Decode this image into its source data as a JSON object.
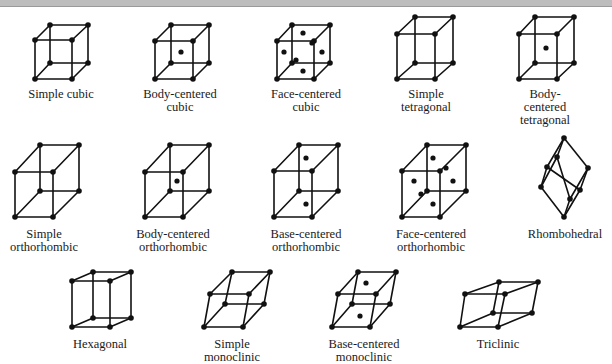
{
  "colors": {
    "line": "#111111",
    "background": "#ffffff",
    "topbar": "#bdbdbd"
  },
  "lattices": [
    {
      "name": "Simple cubic",
      "caption": "Simple cubic",
      "caption_pos": [
        61,
        88
      ],
      "box": {
        "front": [
          [
            35,
            40
          ],
          [
            72,
            40
          ],
          [
            72,
            79
          ],
          [
            35,
            79
          ]
        ],
        "back": [
          [
            50,
            25
          ],
          [
            88,
            25
          ],
          [
            88,
            63
          ],
          [
            50,
            63
          ]
        ]
      },
      "centers": []
    },
    {
      "name": "Body-centered cubic",
      "caption": "Body-centered\ncubic",
      "caption_pos": [
        180,
        88
      ],
      "box": {
        "front": [
          [
            155,
            41
          ],
          [
            193,
            41
          ],
          [
            193,
            79
          ],
          [
            155,
            79
          ]
        ],
        "back": [
          [
            171,
            25
          ],
          [
            209,
            25
          ],
          [
            209,
            63
          ],
          [
            171,
            63
          ]
        ]
      },
      "centers": [
        [
          181,
          52
        ]
      ]
    },
    {
      "name": "Face-centered cubic",
      "caption": "Face-centered\ncubic",
      "caption_pos": [
        306,
        88
      ],
      "box": {
        "front": [
          [
            277,
            41
          ],
          [
            314,
            41
          ],
          [
            314,
            79
          ],
          [
            277,
            79
          ]
        ],
        "back": [
          [
            292,
            25
          ],
          [
            330,
            25
          ],
          [
            330,
            63
          ],
          [
            292,
            63
          ]
        ]
      },
      "centers": [
        [
          303,
          33
        ],
        [
          303,
          71
        ],
        [
          284,
          52
        ],
        [
          322,
          52
        ],
        [
          296,
          60
        ],
        [
          312,
          43
        ]
      ]
    },
    {
      "name": "Simple tetragonal",
      "caption": "Simple\ntetragonal",
      "caption_pos": [
        426,
        88
      ],
      "box": {
        "front": [
          [
            397,
            34
          ],
          [
            435,
            34
          ],
          [
            435,
            79
          ],
          [
            397,
            79
          ]
        ],
        "back": [
          [
            415,
            17
          ],
          [
            453,
            17
          ],
          [
            453,
            63
          ],
          [
            415,
            63
          ]
        ]
      },
      "centers": []
    },
    {
      "name": "Body-centered tetragonal",
      "caption": "Body-centered\ntetragonal",
      "caption_pos": [
        545,
        88
      ],
      "box": {
        "front": [
          [
            519,
            34
          ],
          [
            557,
            34
          ],
          [
            557,
            79
          ],
          [
            519,
            79
          ]
        ],
        "back": [
          [
            535,
            17
          ],
          [
            574,
            17
          ],
          [
            574,
            63
          ],
          [
            535,
            63
          ]
        ]
      },
      "centers": [
        [
          546,
          48
        ]
      ]
    },
    {
      "name": "Simple orthorhombic",
      "caption": "Simple\northorhombic",
      "caption_pos": [
        44,
        228
      ],
      "box": {
        "front": [
          [
            15,
            172
          ],
          [
            53,
            172
          ],
          [
            53,
            217
          ],
          [
            15,
            217
          ]
        ],
        "back": [
          [
            40,
            145
          ],
          [
            79,
            145
          ],
          [
            79,
            191
          ],
          [
            40,
            191
          ]
        ]
      },
      "centers": []
    },
    {
      "name": "Body-centered orthorhombic",
      "caption": "Body-centered\northorhombic",
      "caption_pos": [
        173,
        228
      ],
      "box": {
        "front": [
          [
            145,
            172
          ],
          [
            183,
            172
          ],
          [
            183,
            217
          ],
          [
            145,
            217
          ]
        ],
        "back": [
          [
            170,
            145
          ],
          [
            209,
            145
          ],
          [
            209,
            191
          ],
          [
            170,
            191
          ]
        ]
      },
      "centers": [
        [
          177,
          181
        ]
      ]
    },
    {
      "name": "Base-centered orthorhombic",
      "caption": "Base-centered\northorhombic",
      "caption_pos": [
        306,
        228
      ],
      "box": {
        "front": [
          [
            274,
            171
          ],
          [
            312,
            171
          ],
          [
            312,
            217
          ],
          [
            274,
            217
          ]
        ],
        "back": [
          [
            299,
            145
          ],
          [
            338,
            145
          ],
          [
            338,
            191
          ],
          [
            299,
            191
          ]
        ]
      },
      "centers": [
        [
          306,
          158
        ],
        [
          306,
          204
        ]
      ]
    },
    {
      "name": "Face-centered orthorhombic",
      "caption": "Face-centered\northorhombic",
      "caption_pos": [
        431,
        228
      ],
      "box": {
        "front": [
          [
            402,
            171
          ],
          [
            440,
            171
          ],
          [
            440,
            217
          ],
          [
            402,
            217
          ]
        ],
        "back": [
          [
            427,
            145
          ],
          [
            466,
            145
          ],
          [
            466,
            191
          ],
          [
            427,
            191
          ]
        ]
      },
      "centers": [
        [
          433,
          158
        ],
        [
          433,
          204
        ],
        [
          414,
          181
        ],
        [
          453,
          181
        ],
        [
          421,
          194
        ],
        [
          446,
          168
        ]
      ]
    },
    {
      "name": "Rhombohedral",
      "caption": "Rhombohedral",
      "caption_pos": [
        565,
        228
      ],
      "poly": {
        "points": {
          "t": [
            564,
            138
          ],
          "a": [
            557,
            157
          ],
          "b": [
            547,
            167
          ],
          "c": [
            588,
            168
          ],
          "d": [
            541,
            187
          ],
          "e": [
            580,
            190
          ],
          "f": [
            570,
            199
          ],
          "bot": [
            564,
            217
          ]
        },
        "edges": [
          [
            "t",
            "b"
          ],
          [
            "t",
            "c"
          ],
          [
            "t",
            "a"
          ],
          [
            "a",
            "d"
          ],
          [
            "a",
            "f"
          ],
          [
            "b",
            "d"
          ],
          [
            "b",
            "e"
          ],
          [
            "c",
            "e"
          ],
          [
            "c",
            "f"
          ],
          [
            "d",
            "bot"
          ],
          [
            "e",
            "bot"
          ],
          [
            "f",
            "bot"
          ]
        ]
      },
      "centers": []
    },
    {
      "name": "Hexagonal",
      "caption": "Hexagonal",
      "caption_pos": [
        100,
        338
      ],
      "box": {
        "front": [
          [
            72,
            281
          ],
          [
            110,
            281
          ],
          [
            110,
            327
          ],
          [
            72,
            327
          ]
        ],
        "back": [
          [
            93,
            272
          ],
          [
            131,
            272
          ],
          [
            131,
            318
          ],
          [
            93,
            318
          ]
        ]
      },
      "centers": []
    },
    {
      "name": "Simple monoclinic",
      "caption": "Simple\nmonoclinic",
      "caption_pos": [
        232,
        338
      ],
      "box": {
        "front": [
          [
            210,
            294
          ],
          [
            249,
            294
          ],
          [
            243,
            327
          ],
          [
            204,
            327
          ]
        ],
        "back": [
          [
            232,
            272
          ],
          [
            270,
            272
          ],
          [
            264,
            304
          ],
          [
            225,
            304
          ]
        ]
      },
      "centers": []
    },
    {
      "name": "Base-centered monoclinic",
      "caption": "Base-centered\nmonoclinic",
      "caption_pos": [
        364,
        338
      ],
      "box": {
        "front": [
          [
            338,
            294
          ],
          [
            376,
            294
          ],
          [
            370,
            327
          ],
          [
            332,
            327
          ]
        ],
        "back": [
          [
            358,
            272
          ],
          [
            396,
            272
          ],
          [
            390,
            304
          ],
          [
            352,
            304
          ]
        ]
      },
      "centers": [
        [
          366,
          283
        ],
        [
          360,
          316
        ]
      ]
    },
    {
      "name": "Triclinic",
      "caption": "Triclinic",
      "caption_pos": [
        498,
        338
      ],
      "box": {
        "front": [
          [
            465,
            294
          ],
          [
            505,
            294
          ],
          [
            498,
            327
          ],
          [
            460,
            327
          ]
        ],
        "back": [
          [
            499,
            282
          ],
          [
            538,
            282
          ],
          [
            532,
            313
          ],
          [
            493,
            313
          ]
        ]
      },
      "centers": []
    }
  ]
}
